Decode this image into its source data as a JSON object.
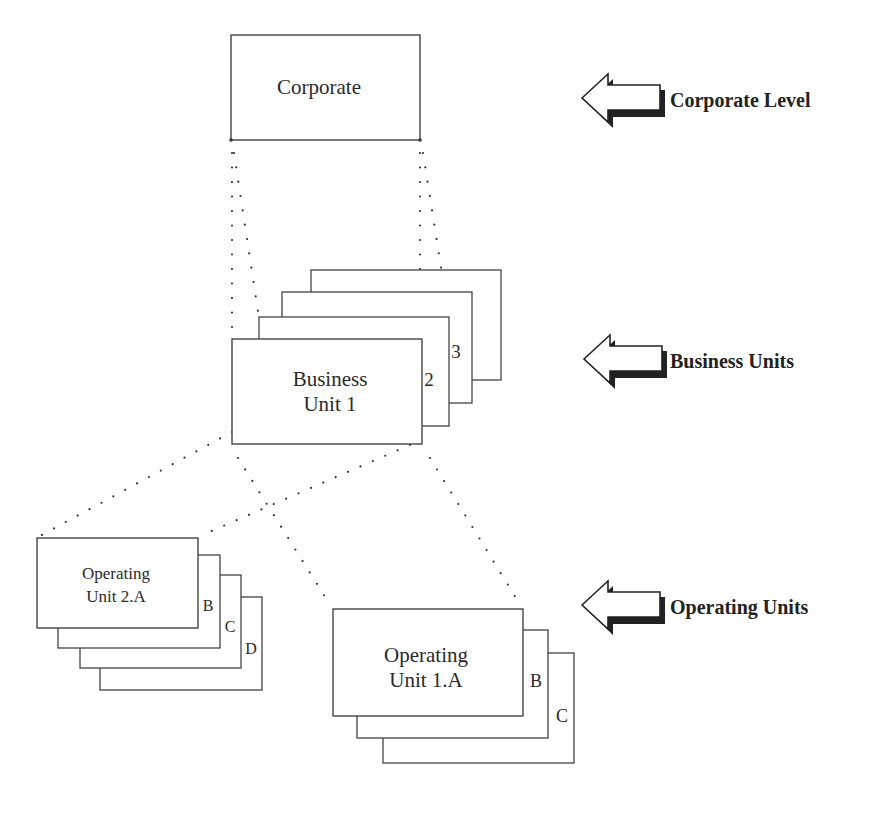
{
  "diagram": {
    "corporate": {
      "label": "Corporate"
    },
    "business_units": {
      "front_label_line1": "Business",
      "front_label_line2": "Unit 1",
      "stack_tabs": [
        "2",
        "3"
      ]
    },
    "operating_unit_2": {
      "front_label_line1": "Operating",
      "front_label_line2": "Unit 2.A",
      "stack_tabs": [
        "B",
        "C",
        "D"
      ]
    },
    "operating_unit_1": {
      "front_label_line1": "Operating",
      "front_label_line2": "Unit 1.A",
      "stack_tabs": [
        "B",
        "C"
      ]
    }
  },
  "level_labels": [
    {
      "icon": "left-arrow-icon",
      "label": "Corporate Level"
    },
    {
      "icon": "left-arrow-icon",
      "label": "Business Units"
    },
    {
      "icon": "left-arrow-icon",
      "label": "Operating Units"
    }
  ],
  "colors": {
    "line": "#444444",
    "dot": "#333333",
    "background": "#ffffff",
    "arrow_shadow": "#222222"
  }
}
